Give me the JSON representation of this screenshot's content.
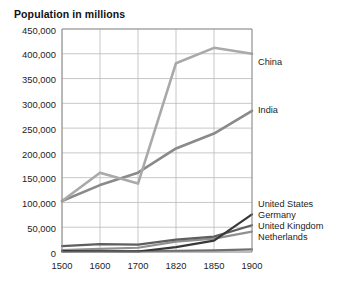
{
  "chart_data": {
    "type": "line",
    "title": "Population in millions",
    "xlabel": "",
    "ylabel": "",
    "categories": [
      "1500",
      "1600",
      "1700",
      "1820",
      "1850",
      "1900"
    ],
    "ylim": [
      0,
      450000
    ],
    "ytick_step": 50000,
    "yticks": [
      "0",
      "50,000",
      "100,000",
      "150,000",
      "200,000",
      "250,000",
      "300,000",
      "350,000",
      "400,000",
      "450,000"
    ],
    "grid": true,
    "legend_position": "right-inline-labels",
    "series": [
      {
        "name": "China",
        "color": "#a9a9a9",
        "values": [
          103000,
          160000,
          138000,
          381000,
          412000,
          400000
        ],
        "label_x": "1900",
        "label_text": "China"
      },
      {
        "name": "India",
        "color": "#8a8a8a",
        "values": [
          103000,
          135000,
          160000,
          209000,
          239000,
          285000
        ],
        "label_x": "1900",
        "label_text": "India"
      },
      {
        "name": "United States",
        "color": "#383838",
        "values": [
          2000,
          1500,
          1000,
          10000,
          23000,
          76000
        ],
        "label_text": "United States"
      },
      {
        "name": "Germany",
        "color": "#5e5e5e",
        "values": [
          12000,
          16000,
          15000,
          25000,
          31000,
          54000
        ],
        "label_text": "Germany"
      },
      {
        "name": "United Kingdom",
        "color": "#909090",
        "values": [
          3900,
          6200,
          8600,
          21000,
          27000,
          41000
        ],
        "label_text": "United Kingdom"
      },
      {
        "name": "Netherlands",
        "color": "#6f6f6f",
        "values": [
          950,
          1500,
          1900,
          2400,
          3100,
          5100
        ],
        "label_text": "Netherlands"
      }
    ]
  },
  "labels": {
    "china": "China",
    "india": "India",
    "united_states": "United States",
    "germany": "Germany",
    "united_kingdom": "United Kingdom",
    "netherlands": "Netherlands"
  },
  "yticks": {
    "t0": "0",
    "t1": "50,000",
    "t2": "100,000",
    "t3": "150,000",
    "t4": "200,000",
    "t5": "250,000",
    "t6": "300,000",
    "t7": "350,000",
    "t8": "400,000",
    "t9": "450,000"
  },
  "xticks": {
    "t0": "1500",
    "t1": "1600",
    "t2": "1700",
    "t3": "1820",
    "t4": "1850",
    "t5": "1900"
  },
  "colors": {
    "background": "#ffffff",
    "grid": "#b9b9b9",
    "axis": "#8e8e8e",
    "text": "#1c1c1c"
  }
}
